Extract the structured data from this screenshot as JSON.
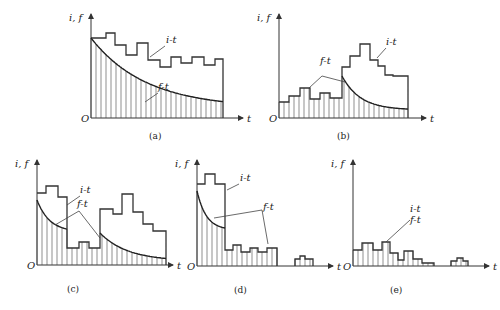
{
  "figure": {
    "panels": [
      {
        "id": "a",
        "caption": "(a)",
        "origin": [
          91,
          118
        ],
        "axis_top": 14,
        "axis_right": 243,
        "y_label": "i, f",
        "x_label": "t",
        "origin_label": "O",
        "i_t": [
          [
            91,
            38
          ],
          [
            106,
            38
          ],
          [
            106,
            33
          ],
          [
            115,
            33
          ],
          [
            115,
            45
          ],
          [
            126,
            45
          ],
          [
            126,
            55
          ],
          [
            137,
            55
          ],
          [
            137,
            43
          ],
          [
            148,
            43
          ],
          [
            148,
            60
          ],
          [
            160,
            60
          ],
          [
            160,
            67
          ],
          [
            171,
            67
          ],
          [
            171,
            57
          ],
          [
            181,
            57
          ],
          [
            181,
            63
          ],
          [
            192,
            63
          ],
          [
            192,
            57
          ],
          [
            204,
            57
          ],
          [
            204,
            65
          ],
          [
            215,
            65
          ],
          [
            215,
            59
          ],
          [
            223,
            59
          ],
          [
            223,
            118
          ]
        ],
        "f_t_curve": {
          "x0": 91,
          "x1": 223,
          "y_start": 38,
          "y_end": 108,
          "k": 0.04
        },
        "hatch_x0": 91,
        "hatch_x1": 223,
        "hatch_step": 5,
        "labels": [
          {
            "text": "i-t",
            "x": 166,
            "y": 43,
            "lx1": 150,
            "ly1": 57,
            "lx2": 165,
            "ly2": 46
          },
          {
            "text": "f-t",
            "x": 158,
            "y": 90,
            "lx1": 145,
            "ly1": 102,
            "lx2": 158,
            "ly2": 93
          }
        ]
      },
      {
        "id": "b",
        "caption": "(b)",
        "origin": [
          279,
          118
        ],
        "axis_top": 14,
        "axis_right": 426,
        "y_label": "i, f",
        "x_label": "t",
        "origin_label": "O",
        "i_t": [
          [
            279,
            102
          ],
          [
            289,
            102
          ],
          [
            289,
            96
          ],
          [
            300,
            96
          ],
          [
            300,
            88
          ],
          [
            310,
            88
          ],
          [
            310,
            99
          ],
          [
            320,
            99
          ],
          [
            320,
            93
          ],
          [
            330,
            93
          ],
          [
            330,
            98
          ],
          [
            342,
            98
          ],
          [
            342,
            67
          ],
          [
            350,
            67
          ],
          [
            350,
            56
          ],
          [
            360,
            56
          ],
          [
            360,
            44
          ],
          [
            370,
            44
          ],
          [
            370,
            60
          ],
          [
            378,
            60
          ],
          [
            378,
            66
          ],
          [
            385,
            66
          ],
          [
            385,
            75
          ],
          [
            393,
            75
          ],
          [
            393,
            76
          ],
          [
            408,
            76
          ],
          [
            408,
            118
          ]
        ],
        "f_t_piece": [
          [
            279,
            102
          ],
          [
            289,
            102
          ],
          [
            289,
            96
          ],
          [
            300,
            96
          ],
          [
            300,
            88
          ],
          [
            310,
            88
          ],
          [
            310,
            99
          ],
          [
            320,
            99
          ],
          [
            320,
            93
          ],
          [
            330,
            93
          ],
          [
            330,
            98
          ],
          [
            342,
            98
          ]
        ],
        "f_t_curve": {
          "x0": 342,
          "x1": 408,
          "y_start": 76,
          "y_end": 110,
          "k": 0.06
        },
        "hatch_x0": 279,
        "hatch_x1": 408,
        "hatch_step": 5,
        "labels": [
          {
            "text": "i-t",
            "x": 386,
            "y": 45,
            "lx1": 377,
            "ly1": 58,
            "lx2": 386,
            "ly2": 48
          },
          {
            "text": "f-t",
            "x": 320,
            "y": 64,
            "lx1": 309,
            "ly1": 88,
            "lx2": 322,
            "ly2": 76,
            "lx3": 345,
            "ly3": 82
          }
        ]
      },
      {
        "id": "c",
        "caption": "(c)",
        "origin": [
          37,
          265
        ],
        "axis_top": 160,
        "axis_right": 173,
        "y_label": "i, f",
        "x_label": "t",
        "origin_label": "O",
        "i_t": [
          [
            37,
            193
          ],
          [
            46,
            193
          ],
          [
            46,
            186
          ],
          [
            58,
            186
          ],
          [
            58,
            197
          ],
          [
            67,
            197
          ],
          [
            67,
            248
          ],
          [
            79,
            248
          ],
          [
            79,
            242
          ],
          [
            89,
            242
          ],
          [
            89,
            248
          ],
          [
            100,
            248
          ],
          [
            100,
            209
          ],
          [
            113,
            209
          ],
          [
            113,
            214
          ],
          [
            122,
            214
          ],
          [
            122,
            194
          ],
          [
            133,
            194
          ],
          [
            133,
            212
          ],
          [
            143,
            212
          ],
          [
            143,
            224
          ],
          [
            153,
            224
          ],
          [
            153,
            231
          ],
          [
            166,
            231
          ],
          [
            166,
            265
          ]
        ],
        "f_t_curve_1": {
          "x0": 37,
          "x1": 67,
          "y_start": 200,
          "y_end": 232,
          "k": 0.04
        },
        "f_t_piece": [
          [
            67,
            248
          ],
          [
            79,
            248
          ],
          [
            79,
            242
          ],
          [
            89,
            242
          ],
          [
            89,
            248
          ],
          [
            100,
            248
          ]
        ],
        "f_t_curve_2": {
          "x0": 100,
          "x1": 166,
          "y_start": 233,
          "y_end": 261,
          "k": 0.04
        },
        "hatch_x0": 37,
        "hatch_x1": 166,
        "hatch_step": 5,
        "labels": [
          {
            "text": "i-t",
            "x": 80,
            "y": 193,
            "lx1": 67,
            "ly1": 205,
            "lx2": 80,
            "ly2": 196
          },
          {
            "text": "f-t",
            "x": 77,
            "y": 207,
            "lx1": 55,
            "ly1": 225,
            "lx2": 79,
            "ly2": 211,
            "lx3": 100,
            "ly3": 238
          }
        ]
      },
      {
        "id": "d",
        "caption": "(d)",
        "origin": [
          197,
          266
        ],
        "axis_top": 160,
        "axis_right": 333,
        "y_label": "i, f",
        "x_label": "t",
        "origin_label": "O",
        "i_t": [
          [
            197,
            184
          ],
          [
            205,
            184
          ],
          [
            205,
            174
          ],
          [
            215,
            174
          ],
          [
            215,
            184
          ],
          [
            225,
            184
          ],
          [
            225,
            250
          ],
          [
            233,
            250
          ],
          [
            233,
            245
          ],
          [
            241,
            245
          ],
          [
            241,
            252
          ],
          [
            250,
            252
          ],
          [
            250,
            248
          ],
          [
            258,
            248
          ],
          [
            258,
            252
          ],
          [
            267,
            252
          ],
          [
            267,
            248
          ],
          [
            277,
            248
          ],
          [
            277,
            266
          ]
        ],
        "f_t_curve": {
          "x0": 197,
          "x1": 225,
          "y_start": 191,
          "y_end": 230,
          "k": 0.05
        },
        "f_t_piece": [
          [
            225,
            250
          ],
          [
            233,
            250
          ],
          [
            233,
            245
          ],
          [
            241,
            245
          ],
          [
            241,
            252
          ],
          [
            250,
            252
          ],
          [
            250,
            248
          ],
          [
            258,
            248
          ],
          [
            258,
            252
          ],
          [
            267,
            252
          ],
          [
            267,
            248
          ],
          [
            277,
            248
          ]
        ],
        "bump": [
          [
            295,
            266
          ],
          [
            295,
            259
          ],
          [
            300,
            259
          ],
          [
            300,
            256
          ],
          [
            305,
            256
          ],
          [
            305,
            259
          ],
          [
            313,
            259
          ],
          [
            313,
            266
          ]
        ],
        "hatch_x0": 197,
        "hatch_x1": 277,
        "bump_hatch_x0": 295,
        "bump_hatch_x1": 313,
        "hatch_step": 5,
        "labels": [
          {
            "text": "i-t",
            "x": 240,
            "y": 181,
            "lx1": 227,
            "ly1": 190,
            "lx2": 239,
            "ly2": 184
          },
          {
            "text": "f-t",
            "x": 263,
            "y": 210,
            "lx1": 214,
            "ly1": 218,
            "lx2": 262,
            "ly2": 210,
            "lx3": 268,
            "ly3": 244
          }
        ]
      },
      {
        "id": "e",
        "caption": "(e)",
        "origin": [
          353,
          266
        ],
        "axis_top": 160,
        "axis_right": 489,
        "y_label": "i, f",
        "x_label": "t",
        "origin_label": "O",
        "i_t": [
          [
            353,
            250
          ],
          [
            362,
            250
          ],
          [
            362,
            243
          ],
          [
            373,
            243
          ],
          [
            373,
            250
          ],
          [
            382,
            250
          ],
          [
            382,
            242
          ],
          [
            390,
            242
          ],
          [
            390,
            253
          ],
          [
            398,
            253
          ],
          [
            398,
            260
          ],
          [
            404,
            260
          ],
          [
            404,
            251
          ],
          [
            413,
            251
          ],
          [
            413,
            259
          ],
          [
            422,
            259
          ],
          [
            422,
            263
          ],
          [
            434,
            263
          ],
          [
            434,
            266
          ]
        ],
        "bump": [
          [
            451,
            266
          ],
          [
            451,
            261
          ],
          [
            457,
            261
          ],
          [
            457,
            258
          ],
          [
            463,
            258
          ],
          [
            463,
            261
          ],
          [
            468,
            261
          ],
          [
            468,
            266
          ]
        ],
        "hatch_x0": 353,
        "hatch_x1": 434,
        "bump_hatch_x0": 451,
        "bump_hatch_x1": 468,
        "hatch_step": 5,
        "labels": [
          {
            "text": "i-t",
            "x": 410,
            "y": 212,
            "lx1": 386,
            "ly1": 242,
            "lx2": 410,
            "ly2": 220
          },
          {
            "text": "f-t",
            "x": 410,
            "y": 223
          }
        ]
      }
    ]
  }
}
